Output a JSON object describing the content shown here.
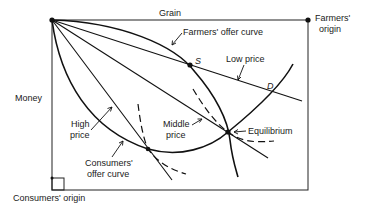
{
  "diagram": {
    "axis_top_label": "Grain",
    "axis_left_label": "Money",
    "farmers_origin": {
      "line1": "Farmers'",
      "line2": "origin"
    },
    "consumers_origin": "Consumers' origin",
    "farmers_offer_curve": "Farmers' offer curve",
    "consumers_offer_curve": {
      "line1": "Consumers'",
      "line2": "offer curve"
    },
    "low_price": "Low price",
    "middle_price": {
      "line1": "Middle",
      "line2": "price"
    },
    "high_price": {
      "line1": "High",
      "line2": "price"
    },
    "equilibrium": "Equilibrium",
    "point_s": "S",
    "point_d": "D"
  }
}
